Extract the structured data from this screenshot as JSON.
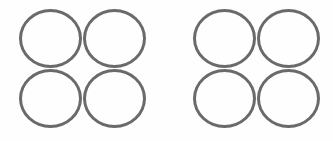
{
  "diagram": {
    "background": "#ffffff",
    "stroke_color": "#6a6a6a",
    "groups": [
      {
        "name": "left-group",
        "rows": 2,
        "cols": 2,
        "circles": [
          {
            "row": 0,
            "col": 0,
            "filled": false
          },
          {
            "row": 0,
            "col": 1,
            "filled": false
          },
          {
            "row": 1,
            "col": 0,
            "filled": false
          },
          {
            "row": 1,
            "col": 1,
            "filled": false
          }
        ]
      },
      {
        "name": "right-group",
        "rows": 2,
        "cols": 2,
        "circles": [
          {
            "row": 0,
            "col": 0,
            "filled": false
          },
          {
            "row": 0,
            "col": 1,
            "filled": false
          },
          {
            "row": 1,
            "col": 0,
            "filled": false
          },
          {
            "row": 1,
            "col": 1,
            "filled": false
          }
        ]
      }
    ],
    "total_circles": 8
  }
}
